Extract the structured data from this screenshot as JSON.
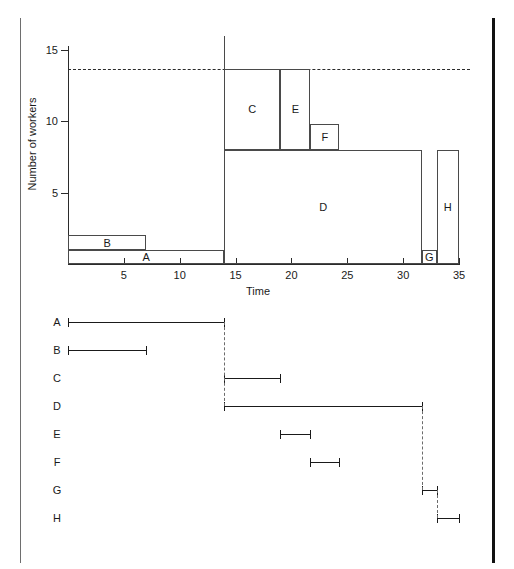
{
  "figure": {
    "title": "",
    "top_panel_name": "resource-histogram",
    "bottom_panel_name": "activity-bar-chart"
  },
  "chart_data": [
    {
      "type": "bar",
      "name": "resource-histogram",
      "title": "",
      "xlabel": "Time",
      "ylabel": "Number of workers",
      "xlim": [
        0,
        36
      ],
      "ylim": [
        0,
        16
      ],
      "xticks": [
        5,
        10,
        15,
        20,
        25,
        30,
        35
      ],
      "xtick_labels": [
        "5",
        "10",
        "15",
        "20",
        "25",
        "30",
        "35"
      ],
      "yticks": [
        5,
        10,
        15
      ],
      "ytick_labels": [
        "5",
        "10",
        "15"
      ],
      "grid": false,
      "legend": "none",
      "annotations": [
        {
          "name": "resource-limit-line",
          "style": "dashed",
          "y": 13.7,
          "x_from": 0,
          "x_to": 36,
          "label": ""
        },
        {
          "name": "phase-split-line",
          "style": "solid",
          "x": 14,
          "y_from": 0,
          "y_to": 16,
          "label": ""
        }
      ],
      "blocks": [
        {
          "label": "A",
          "x_start": 0,
          "x_end": 14,
          "y_base": 0,
          "y_top": 1
        },
        {
          "label": "B",
          "x_start": 0,
          "x_end": 7,
          "y_base": 1,
          "y_top": 2
        },
        {
          "label": "C",
          "x_start": 14,
          "x_end": 19,
          "y_base": 8,
          "y_top": 13.7
        },
        {
          "label": "D",
          "x_start": 14,
          "x_end": 31.7,
          "y_base": 0,
          "y_top": 8
        },
        {
          "label": "E",
          "x_start": 19,
          "x_end": 21.7,
          "y_base": 8,
          "y_top": 13.7
        },
        {
          "label": "F",
          "x_start": 21.7,
          "x_end": 24.3,
          "y_base": 8,
          "y_top": 9.8
        },
        {
          "label": "G",
          "x_start": 31.7,
          "x_end": 33,
          "y_base": 0,
          "y_top": 1
        },
        {
          "label": "H",
          "x_start": 33,
          "x_end": 35,
          "y_base": 0,
          "y_top": 8
        }
      ]
    },
    {
      "type": "bar",
      "name": "activity-bar-chart",
      "title": "",
      "xlabel": "",
      "ylabel": "",
      "xlim": [
        0,
        36
      ],
      "orientation": "horizontal",
      "grid": false,
      "legend": "none",
      "rows": [
        {
          "label": "A",
          "start": 0,
          "end": 14
        },
        {
          "label": "B",
          "start": 0,
          "end": 7
        },
        {
          "label": "C",
          "start": 14,
          "end": 19
        },
        {
          "label": "D",
          "start": 14,
          "end": 31.7
        },
        {
          "label": "E",
          "start": 19,
          "end": 21.7
        },
        {
          "label": "F",
          "start": 21.7,
          "end": 24.3
        },
        {
          "label": "G",
          "start": 31.7,
          "end": 33
        },
        {
          "label": "H",
          "start": 33,
          "end": 35
        }
      ],
      "links": [
        {
          "from_row": "A",
          "to_row": "D",
          "x": 14,
          "style": "dashed"
        },
        {
          "from_row": "D",
          "to_row": "G",
          "x": 31.7,
          "style": "dashed"
        },
        {
          "from_row": "G",
          "to_row": "H",
          "x": 33,
          "style": "dashed"
        }
      ]
    }
  ],
  "colors": {
    "ink": "#1a1a1a",
    "line": "#2b2b2b",
    "block_stroke": "#4a4a4a",
    "link_dash": "#6b6b6b",
    "rail_left": "#6e6e6e",
    "rail_right": "#111111",
    "background": "#ffffff"
  }
}
